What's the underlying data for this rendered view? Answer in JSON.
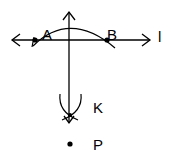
{
  "diagram": {
    "type": "geometry-construction",
    "labels": {
      "line": "l",
      "point_a": "A",
      "point_b": "B",
      "point_k": "K",
      "point_p": "P"
    },
    "colors": {
      "stroke": "#000000",
      "background": "#ffffff"
    }
  }
}
